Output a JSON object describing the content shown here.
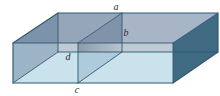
{
  "figure": {
    "type": "3d-rectangular-box-with-cross-section",
    "labels": {
      "a": {
        "text": "a",
        "refers_to": "top-back-edge"
      },
      "b": {
        "text": "b",
        "refers_to": "partition-back-vertical-edge"
      },
      "c": {
        "text": "c",
        "refers_to": "front-bottom-edge"
      },
      "d": {
        "text": "d",
        "refers_to": "partition-front-vertical-edge"
      }
    },
    "colors": {
      "background": "#ffffff",
      "edge": "#2e5a71",
      "label_text": "#2b2f33",
      "top_left_over_side": "#7d92ab",
      "top_left": "#95a6bb",
      "partition_top_triangle": "#8093aa",
      "top_right": "#a7b5c7",
      "right_face": "#3f6a82",
      "left_face_through_front": "#9db4c6",
      "seethrough_band": "#c0cad3",
      "partition_band_left": "#8b9cab",
      "partition_band_right": "#b7c4ce",
      "front_face": "#c9e2ec",
      "partition_front_triangle": "#aecbdb"
    }
  }
}
